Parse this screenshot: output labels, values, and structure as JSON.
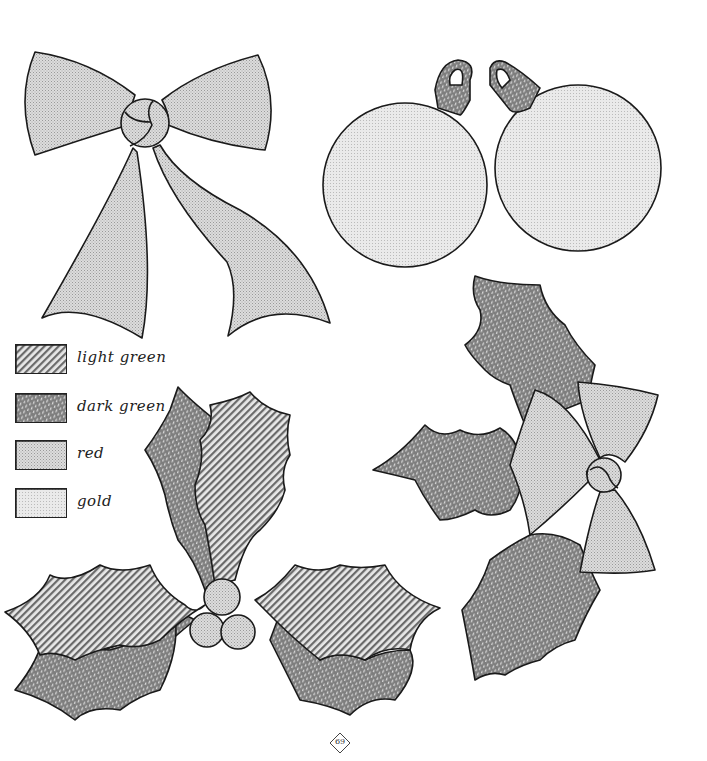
{
  "page": {
    "page_number": "69",
    "type": "holiday craft pattern sheet"
  },
  "legend": {
    "items": [
      {
        "label": "light green",
        "pattern": "diagonal-stripes",
        "fill": "#bdbdbd"
      },
      {
        "label": "dark green",
        "pattern": "dots-on-dark",
        "fill": "#8a8a8a"
      },
      {
        "label": "red",
        "pattern": "fine-stipple",
        "fill": "#d6d6d6"
      },
      {
        "label": "gold",
        "pattern": "light-stipple",
        "fill": "#e4e4e4"
      }
    ]
  },
  "shapes": [
    {
      "name": "bow-large",
      "color": "red"
    },
    {
      "name": "ornament-left",
      "color": "gold",
      "cap_color": "dark green"
    },
    {
      "name": "ornament-right",
      "color": "gold",
      "cap_color": "dark green"
    },
    {
      "name": "holly-berries-sprig",
      "leaves": [
        "light green",
        "dark green"
      ],
      "berries": "red"
    },
    {
      "name": "holly-bow-sprig",
      "leaves": "dark green",
      "bow": "red"
    }
  ],
  "colors": {
    "outline": "#1a1a1a",
    "background": "#ffffff"
  }
}
